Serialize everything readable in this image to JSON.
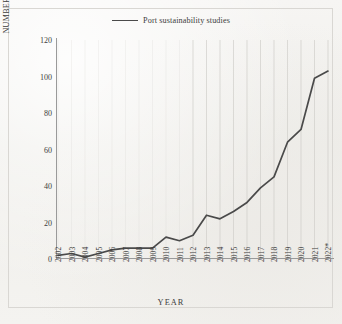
{
  "figure": {
    "legend_label": "Port sustainability studies",
    "legend_marker": "line-swatch",
    "line_color": "#4a4a4a",
    "axis_color": "#9a9a9a",
    "gridline_color": "#cfcdc9",
    "background_color": "#f2f1ef"
  },
  "chart_data": {
    "type": "line",
    "title": "",
    "xlabel": "YEAR",
    "ylabel": "NUMBER OF PUBLICATIONS",
    "legend": [
      "Port sustainability studies"
    ],
    "legend_position": "top-center",
    "grid": "vertical",
    "ylim": [
      0,
      120
    ],
    "yticks": [
      0,
      20,
      40,
      60,
      80,
      100,
      120
    ],
    "categories": [
      "2002",
      "2003",
      "2004",
      "2005",
      "2006",
      "2007",
      "2008",
      "2009",
      "2010",
      "2011",
      "2012",
      "2013",
      "2014",
      "2015",
      "2016",
      "2017",
      "2018",
      "2019",
      "2020",
      "2021",
      "2022*"
    ],
    "series": [
      {
        "name": "Port sustainability studies",
        "values": [
          2,
          3,
          1,
          3,
          5,
          6,
          6,
          6,
          12,
          10,
          13,
          24,
          22,
          26,
          31,
          39,
          45,
          64,
          71,
          99,
          103
        ]
      }
    ],
    "footnote_marker": "*"
  }
}
